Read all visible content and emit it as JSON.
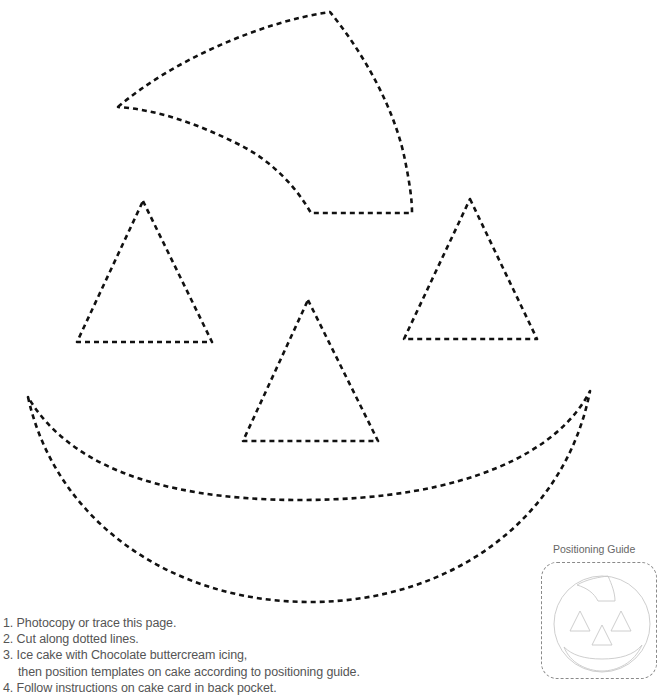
{
  "page": {
    "type": "cake decorating template"
  },
  "template_pieces": [
    {
      "name": "stem",
      "style": "dotted cut line"
    },
    {
      "name": "left-eye",
      "shape": "triangle",
      "style": "dotted cut line"
    },
    {
      "name": "right-eye",
      "shape": "triangle",
      "style": "dotted cut line"
    },
    {
      "name": "nose",
      "shape": "triangle",
      "style": "dotted cut line"
    },
    {
      "name": "mouth",
      "shape": "crescent",
      "style": "dotted cut line"
    }
  ],
  "instructions": [
    {
      "number": "1.",
      "text": "Photocopy or trace this page."
    },
    {
      "number": "2.",
      "text": "Cut along dotted lines."
    },
    {
      "number": "3.",
      "text": "Ice cake with Chocolate buttercream icing,",
      "continuation": "then position templates on cake according to positioning guide."
    },
    {
      "number": "4.",
      "text": "Follow instructions on cake card in back pocket."
    }
  ],
  "positioning_guide": {
    "title": "Positioning Guide"
  },
  "colors": {
    "cut_line": "#111111",
    "text": "#555555",
    "guide_line": "#c8c8c8",
    "guide_border": "#8a8a8a"
  }
}
